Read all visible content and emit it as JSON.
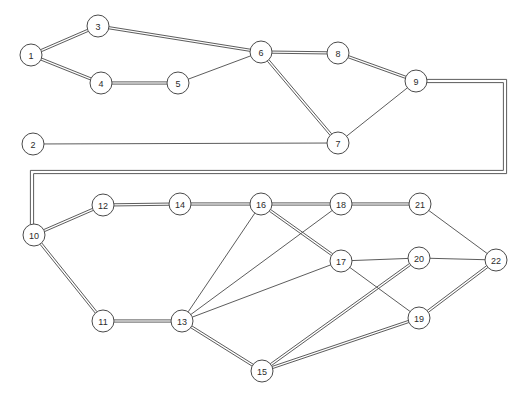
{
  "diagram": {
    "type": "node-link-graph",
    "background_color": "#ffffff",
    "node_fill_color": "#ffffff",
    "node_stroke_color": "#4a4a4a",
    "edge_color": "#4a4a4a",
    "label_color": "#2b2b2b",
    "node_radius": 11,
    "width": 522,
    "height": 397
  },
  "nodes": [
    {
      "id": "1",
      "label": "1",
      "x": 31,
      "y": 55
    },
    {
      "id": "2",
      "label": "2",
      "x": 33,
      "y": 144
    },
    {
      "id": "3",
      "label": "3",
      "x": 98,
      "y": 26
    },
    {
      "id": "4",
      "label": "4",
      "x": 101,
      "y": 83
    },
    {
      "id": "5",
      "label": "5",
      "x": 178,
      "y": 83
    },
    {
      "id": "6",
      "label": "6",
      "x": 261,
      "y": 52
    },
    {
      "id": "7",
      "label": "7",
      "x": 338,
      "y": 143
    },
    {
      "id": "8",
      "label": "8",
      "x": 338,
      "y": 53
    },
    {
      "id": "9",
      "label": "9",
      "x": 416,
      "y": 81
    },
    {
      "id": "10",
      "label": "10",
      "x": 34,
      "y": 235
    },
    {
      "id": "11",
      "label": "11",
      "x": 103,
      "y": 321
    },
    {
      "id": "12",
      "label": "12",
      "x": 103,
      "y": 205
    },
    {
      "id": "13",
      "label": "13",
      "x": 182,
      "y": 321
    },
    {
      "id": "14",
      "label": "14",
      "x": 180,
      "y": 204
    },
    {
      "id": "15",
      "label": "15",
      "x": 262,
      "y": 371
    },
    {
      "id": "16",
      "label": "16",
      "x": 261,
      "y": 204
    },
    {
      "id": "17",
      "label": "17",
      "x": 341,
      "y": 261
    },
    {
      "id": "18",
      "label": "18",
      "x": 341,
      "y": 204
    },
    {
      "id": "19",
      "label": "19",
      "x": 419,
      "y": 318
    },
    {
      "id": "20",
      "label": "20",
      "x": 419,
      "y": 258
    },
    {
      "id": "21",
      "label": "21",
      "x": 420,
      "y": 204
    },
    {
      "id": "22",
      "label": "22",
      "x": 496,
      "y": 260
    }
  ],
  "edges": [
    {
      "from": "1",
      "to": "3",
      "style": "double"
    },
    {
      "from": "1",
      "to": "4",
      "style": "double"
    },
    {
      "from": "3",
      "to": "6",
      "style": "double"
    },
    {
      "from": "4",
      "to": "5",
      "style": "double"
    },
    {
      "from": "5",
      "to": "6",
      "style": "single"
    },
    {
      "from": "6",
      "to": "8",
      "style": "double"
    },
    {
      "from": "6",
      "to": "7",
      "style": "double"
    },
    {
      "from": "8",
      "to": "9",
      "style": "double"
    },
    {
      "from": "7",
      "to": "9",
      "style": "single"
    },
    {
      "from": "10",
      "to": "12",
      "style": "double"
    },
    {
      "from": "10",
      "to": "11",
      "style": "double"
    },
    {
      "from": "12",
      "to": "14",
      "style": "double"
    },
    {
      "from": "14",
      "to": "16",
      "style": "double"
    },
    {
      "from": "16",
      "to": "18",
      "style": "double"
    },
    {
      "from": "16",
      "to": "17",
      "style": "double"
    },
    {
      "from": "16",
      "to": "13",
      "style": "single"
    },
    {
      "from": "18",
      "to": "21",
      "style": "double"
    },
    {
      "from": "18",
      "to": "13",
      "style": "single"
    },
    {
      "from": "11",
      "to": "13",
      "style": "double"
    },
    {
      "from": "13",
      "to": "17",
      "style": "single"
    },
    {
      "from": "13",
      "to": "15",
      "style": "double"
    },
    {
      "from": "17",
      "to": "20",
      "style": "single"
    },
    {
      "from": "17",
      "to": "19",
      "style": "single"
    },
    {
      "from": "15",
      "to": "20",
      "style": "double"
    },
    {
      "from": "15",
      "to": "19",
      "style": "double"
    },
    {
      "from": "19",
      "to": "22",
      "style": "double"
    },
    {
      "from": "20",
      "to": "22",
      "style": "single"
    },
    {
      "from": "21",
      "to": "22",
      "style": "single"
    }
  ],
  "routed_edges": [
    {
      "id": "edge-2-7",
      "from": "2",
      "to": "7",
      "style": "single",
      "waypoints": [
        [
          33,
          144
        ],
        [
          338,
          143
        ]
      ]
    },
    {
      "id": "edge-9-10",
      "from": "9",
      "to": "10",
      "style": "double",
      "waypoints": [
        [
          416,
          81
        ],
        [
          505,
          81
        ],
        [
          505,
          172
        ],
        [
          32,
          172
        ],
        [
          32,
          235
        ]
      ]
    }
  ]
}
